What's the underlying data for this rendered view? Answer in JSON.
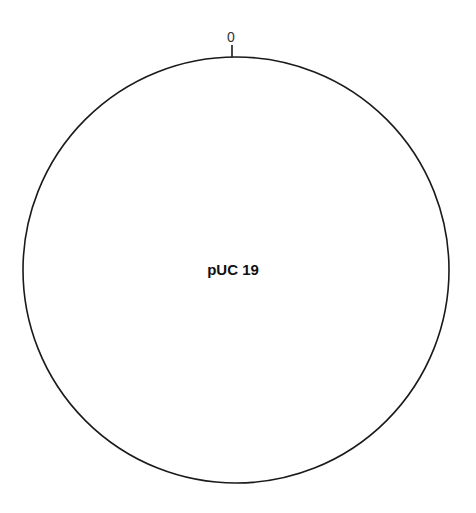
{
  "diagram": {
    "type": "plasmid-map",
    "plasmid_name": "pUC 19",
    "position_markers": [
      {
        "label": "0",
        "angle_deg": 0
      }
    ],
    "colors": {
      "backbone": "#1a1a1a",
      "text": "#111111",
      "background": "#ffffff"
    }
  }
}
